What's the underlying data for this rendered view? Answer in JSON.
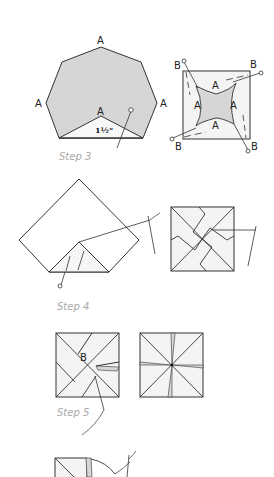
{
  "colors": {
    "line": "#333333",
    "fill_gray": "#d6d6d6",
    "fill_light": "#f4f4f4",
    "step_label": "#a8a8a8"
  },
  "step3": {
    "label": "Step 3",
    "heptagon_labels": [
      "A",
      "A",
      "A",
      "A"
    ],
    "measurement": "1½\"",
    "square_inner_labels": [
      "A",
      "A",
      "A",
      "A"
    ],
    "square_corner_labels": [
      "B",
      "B",
      "B",
      "B"
    ]
  },
  "step4": {
    "label": "Step 4"
  },
  "step5": {
    "label": "Step 5",
    "block_label": "B"
  }
}
